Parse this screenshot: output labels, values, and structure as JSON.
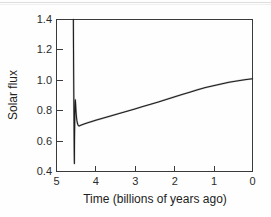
{
  "figure": {
    "background_color": "#fefefe",
    "ink_color": "#1c1c1c",
    "axis_color": "#3a3a3a"
  },
  "chart_data": {
    "type": "line",
    "title": "",
    "xlabel": "Time (billions of years ago)",
    "ylabel": "Solar flux",
    "xlim": [
      5,
      0
    ],
    "ylim": [
      0.4,
      1.4
    ],
    "x_axis_reversed": true,
    "grid": false,
    "legend": null,
    "xticks": [
      5,
      4,
      3,
      2,
      1,
      0
    ],
    "xtick_labels": [
      "5",
      "4",
      "3",
      "2",
      "1",
      "0"
    ],
    "yticks": [
      0.4,
      0.6,
      0.8,
      1.0,
      1.2,
      1.4
    ],
    "ytick_labels": [
      "0.4",
      "0.6",
      "0.8",
      "1.0",
      "1.2",
      "1.4"
    ],
    "series": [
      {
        "name": "Solar flux",
        "x": [
          4.57,
          4.566,
          4.562,
          4.558,
          4.556,
          4.554,
          4.552,
          4.55,
          4.548,
          4.546,
          4.544,
          4.542,
          4.54,
          4.536,
          4.532,
          4.528,
          4.524,
          4.52,
          4.512,
          4.504,
          4.496,
          4.488,
          4.48,
          4.47,
          4.46,
          4.45,
          4.44,
          4.43,
          4.42,
          4.4,
          4.35,
          4.3,
          4.2,
          4.1,
          4.0,
          3.8,
          3.6,
          3.4,
          3.2,
          3.0,
          2.8,
          2.6,
          2.4,
          2.2,
          2.0,
          1.8,
          1.6,
          1.4,
          1.2,
          1.0,
          0.8,
          0.6,
          0.4,
          0.2,
          0.05,
          0.0
        ],
        "y": [
          1.4,
          1.21,
          1.03,
          0.88,
          0.8,
          0.73,
          0.66,
          0.59,
          0.53,
          0.48,
          0.452,
          0.52,
          0.61,
          0.7,
          0.76,
          0.81,
          0.852,
          0.872,
          0.845,
          0.805,
          0.775,
          0.752,
          0.736,
          0.722,
          0.712,
          0.706,
          0.702,
          0.7,
          0.7,
          0.702,
          0.707,
          0.712,
          0.721,
          0.729,
          0.737,
          0.752,
          0.767,
          0.782,
          0.797,
          0.812,
          0.827,
          0.842,
          0.858,
          0.874,
          0.89,
          0.906,
          0.922,
          0.938,
          0.952,
          0.964,
          0.976,
          0.987,
          0.996,
          1.004,
          1.009,
          1.01
        ]
      }
    ],
    "annotations": [
      {
        "name": "pre-main-sequence-spike",
        "text": "",
        "x": 4.55,
        "y_range": [
          0.45,
          1.4
        ],
        "description": "sharp vertical excursion at formation epoch"
      },
      {
        "name": "minimum",
        "text": "",
        "x": 4.43,
        "y": 0.7
      },
      {
        "name": "present-day",
        "text": "",
        "x": 0.0,
        "y": 1.01
      }
    ]
  }
}
